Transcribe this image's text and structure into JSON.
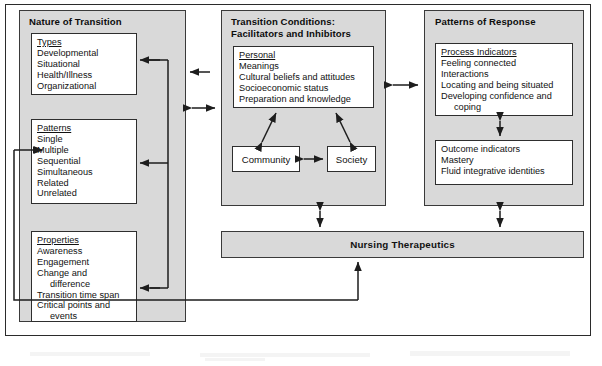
{
  "diagram": {
    "panels": {
      "nature": {
        "title": "Nature of Transition",
        "boxes": [
          {
            "name": "types",
            "heading": "Types",
            "items": [
              "Developmental",
              "Situational",
              "Health/Illness",
              "Organizational"
            ]
          },
          {
            "name": "patterns",
            "heading": "Patterns",
            "items": [
              "Single",
              "Multiple",
              "Sequential",
              "Simultaneous",
              "Related",
              "Unrelated"
            ]
          },
          {
            "name": "properties",
            "heading": "Properties",
            "items": [
              "Awareness",
              "Engagement",
              "Change and",
              "difference",
              "Transition time span",
              "Critical points and",
              "events"
            ],
            "indented": [
              3,
              6
            ]
          }
        ]
      },
      "conditions": {
        "title": "Transition Conditions:\nFacilitators and Inhibitors",
        "boxes": [
          {
            "name": "personal",
            "heading": "Personal",
            "items": [
              "Meanings",
              "Cultural beliefs and attitudes",
              "Socioeconomic status",
              "Preparation and knowledge"
            ]
          }
        ],
        "community_label": "Community",
        "society_label": "Society"
      },
      "response": {
        "title": "Patterns of Response",
        "boxes": [
          {
            "name": "process-indicators",
            "heading": "Process Indicators",
            "items": [
              "Feeling connected",
              "Interactions",
              "Locating and being situated",
              "Developing confidence and",
              "coping"
            ],
            "indented": [
              4
            ]
          },
          {
            "name": "outcome-indicators",
            "heading": "Outcome indicators",
            "heading_underlined": false,
            "items": [
              "Mastery",
              "Fluid integrative identities"
            ]
          }
        ]
      }
    },
    "nursing_therapeutics": "Nursing Therapeutics",
    "colors": {
      "panel_fill": "#d9d9d9",
      "box_fill": "#ffffff",
      "stroke": "#2e2e2e",
      "page": "#ffffff"
    }
  }
}
